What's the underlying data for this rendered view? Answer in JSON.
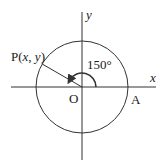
{
  "diagram": {
    "type": "unit-circle-angle",
    "angle_label": "150°",
    "angle_degrees": 150,
    "labels": {
      "x_axis": "x",
      "y_axis": "y",
      "origin": "O",
      "point_a": "A",
      "point_p_prefix": "P(",
      "point_p_x": "x",
      "point_p_sep": ", ",
      "point_p_y": "y",
      "point_p_suffix": ")"
    },
    "colors": {
      "stroke": "#333333",
      "text": "#1a1a1a",
      "background": "#ffffff"
    }
  }
}
